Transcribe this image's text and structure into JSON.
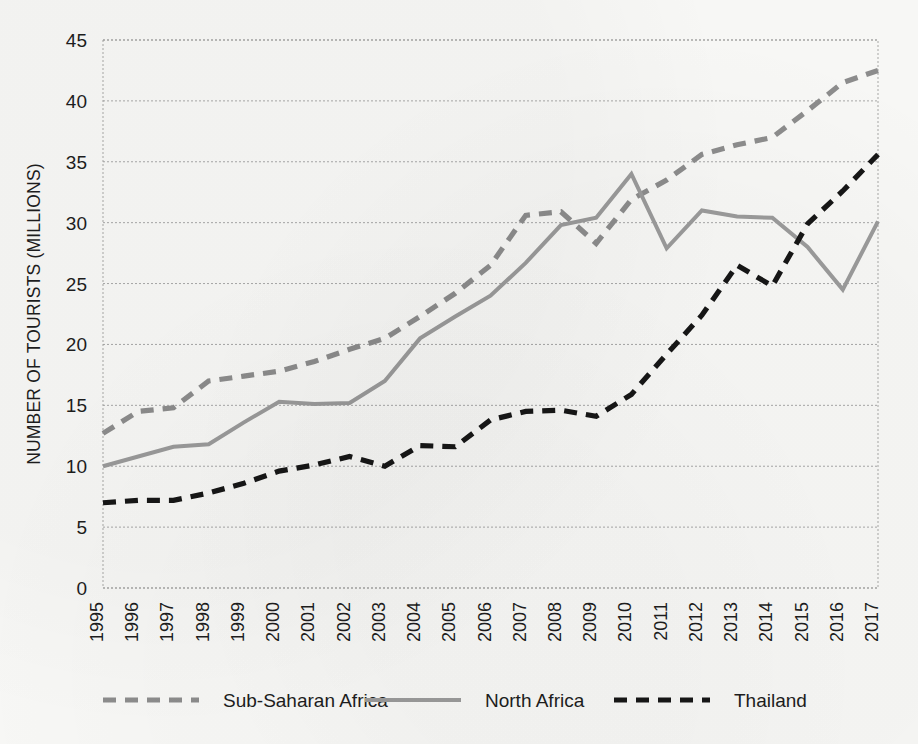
{
  "chart_data": {
    "type": "line",
    "title": "",
    "xlabel": "",
    "ylabel": "NUMBER OF TOURISTS (MILLIONS)",
    "ylim": [
      0,
      45
    ],
    "ytick_values": [
      0,
      5,
      10,
      15,
      20,
      25,
      30,
      35,
      40,
      45
    ],
    "ytick_labels": [
      "0",
      "5",
      "10",
      "15",
      "20",
      "25",
      "30",
      "35",
      "40",
      "45"
    ],
    "grid": true,
    "grid_axis": "y",
    "legend_position": "bottom",
    "categories": [
      "1995",
      "1996",
      "1997",
      "1998",
      "1999",
      "2000",
      "2001",
      "2002",
      "2003",
      "2004",
      "2005",
      "2006",
      "2007",
      "2008",
      "2009",
      "2010",
      "2011",
      "2012",
      "2013",
      "2014",
      "2015",
      "2016",
      "2017"
    ],
    "x": [
      1995,
      1996,
      1997,
      1998,
      1999,
      2000,
      2001,
      2002,
      2003,
      2004,
      2005,
      2006,
      2007,
      2008,
      2009,
      2010,
      2011,
      2012,
      2013,
      2014,
      2015,
      2016,
      2017
    ],
    "series": [
      {
        "name": "Sub-Saharan Africa",
        "style": "dashed",
        "color": "#8c8c8c",
        "values": [
          12.7,
          14.5,
          14.8,
          17.0,
          17.4,
          17.8,
          18.6,
          19.6,
          20.5,
          22.3,
          24.2,
          26.5,
          30.6,
          30.9,
          28.3,
          31.9,
          33.5,
          35.6,
          36.4,
          37.0,
          39.2,
          41.5,
          42.5
        ]
      },
      {
        "name": "North Africa",
        "style": "solid",
        "color": "#9a9a9a",
        "values": [
          10.0,
          10.8,
          11.6,
          11.8,
          13.6,
          15.3,
          15.1,
          15.2,
          17.0,
          20.5,
          22.3,
          24.0,
          26.7,
          29.8,
          30.4,
          34.0,
          27.9,
          31.0,
          30.5,
          30.4,
          28.0,
          24.5,
          30.1
        ]
      },
      {
        "name": "Thailand",
        "style": "dashed",
        "color": "#161616",
        "values": [
          7.0,
          7.2,
          7.2,
          7.8,
          8.6,
          9.6,
          10.1,
          10.8,
          10.0,
          11.7,
          11.6,
          13.8,
          14.5,
          14.6,
          14.1,
          15.9,
          19.2,
          22.4,
          26.5,
          24.8,
          29.9,
          32.6,
          35.6
        ]
      }
    ]
  },
  "legend": {
    "items": [
      {
        "label": "Sub-Saharan Africa",
        "swatch": "dashed-gray"
      },
      {
        "label": "North Africa",
        "swatch": "solid-gray"
      },
      {
        "label": "Thailand",
        "swatch": "dashed-black"
      }
    ]
  },
  "colors": {
    "sub_saharan": "#8c8c8c",
    "north_africa": "#9a9a9a",
    "thailand": "#161616",
    "grid": "#9d9d9d",
    "text": "#1d1d1d",
    "background": "#f7f7f5"
  },
  "geometry": {
    "plot_left": 103,
    "plot_right": 878,
    "plot_top": 40,
    "plot_bottom": 588
  }
}
